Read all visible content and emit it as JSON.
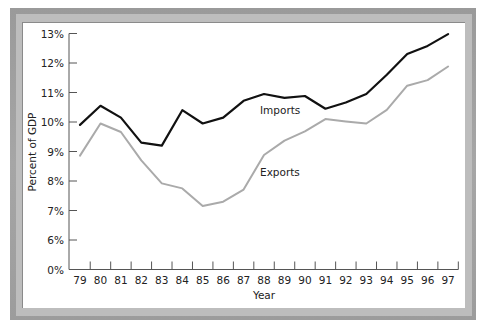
{
  "chart_data": {
    "type": "line",
    "title": "",
    "xlabel": "Year",
    "ylabel": "Percent of GDP",
    "x": [
      "79",
      "80",
      "81",
      "82",
      "83",
      "84",
      "85",
      "86",
      "87",
      "88",
      "89",
      "90",
      "91",
      "92",
      "93",
      "94",
      "95",
      "96",
      "97"
    ],
    "y_ticks": [
      "0%",
      "6%",
      "7%",
      "8%",
      "9%",
      "10%",
      "11%",
      "12%",
      "13%"
    ],
    "ylim": [
      6,
      13
    ],
    "y_axis_break": "0% baseline shown below 6% (broken axis)",
    "grid": false,
    "legend": "inline labels",
    "series": [
      {
        "name": "Imports",
        "color": "#111111",
        "values": [
          9.9,
          10.55,
          10.15,
          9.3,
          9.2,
          10.4,
          9.95,
          10.15,
          10.72,
          10.95,
          10.82,
          10.88,
          10.45,
          10.66,
          10.95,
          11.6,
          12.3,
          12.58,
          12.98
        ]
      },
      {
        "name": "Exports",
        "color": "#aaaaaa",
        "values": [
          8.86,
          9.95,
          9.66,
          8.7,
          7.92,
          7.75,
          7.15,
          7.3,
          7.71,
          8.88,
          9.37,
          9.68,
          10.1,
          10.02,
          9.95,
          10.41,
          11.23,
          11.42,
          11.88
        ]
      }
    ],
    "annotations": [
      {
        "text": "Imports",
        "near_x": "88-89"
      },
      {
        "text": "Exports",
        "near_x": "88-89"
      }
    ]
  },
  "labels": {
    "imports": "Imports",
    "exports": "Exports",
    "xlabel": "Year",
    "ylabel": "Percent of GDP"
  },
  "colors": {
    "imports": "#111111",
    "exports": "#aaaaaa",
    "axis": "#555555",
    "frame": "#a0a0a0"
  }
}
